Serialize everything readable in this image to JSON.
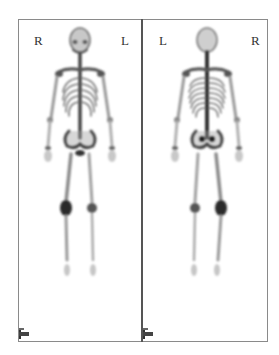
{
  "figure": {
    "type": "whole-body bone scintigraphy",
    "panels": [
      {
        "id": "anterior",
        "view": "anterior",
        "left_label": "R",
        "right_label": "L"
      },
      {
        "id": "posterior",
        "view": "posterior",
        "left_label": "L",
        "right_label": "R"
      }
    ],
    "colors": {
      "background": "#ffffff",
      "frame": "#8a8a8a",
      "divider": "#555555",
      "uptake_dark": "#2a2a2a",
      "uptake_light": "#bdbdbd"
    }
  }
}
